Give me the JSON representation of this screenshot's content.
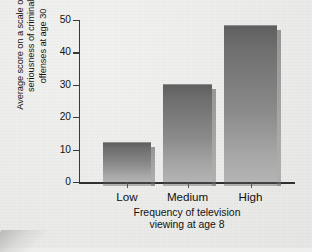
{
  "chart_data": {
    "type": "bar",
    "title": "",
    "categories": [
      "Low",
      "Medium",
      "High"
    ],
    "values": [
      12,
      30,
      48
    ],
    "series": [
      {
        "name": "Average seriousness score",
        "values": [
          12,
          30,
          48
        ]
      }
    ],
    "xlabel": "Frequency of television\nviewing at age 8",
    "ylabel": "Average score on a scale of the\nseriousness of criminal\noffenses at age 30",
    "ylim": [
      0,
      50
    ],
    "yticks": [
      0,
      10,
      20,
      30,
      40,
      50
    ],
    "ytick_labels": [
      "0",
      "10",
      "20",
      "30",
      "40",
      "50"
    ],
    "grid": false,
    "legend": null,
    "bar_fill_top": "#5f5f5f",
    "bar_fill_bottom": "#b4b4b4",
    "axis_color": "#2f2f2f",
    "background_color": "#ececea"
  },
  "axes": {
    "y_title_line1": "Average score on a scale of the",
    "y_title_line2": "seriousness of criminal",
    "y_title_line3": "offenses at age 30",
    "x_title_line1": "Frequency of television",
    "x_title_line2": "viewing at age 8"
  }
}
